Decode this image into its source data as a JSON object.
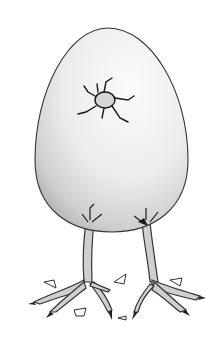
{
  "image": {
    "subject": "Cartoon egg standing on bird legs with a crack near the top",
    "colors": {
      "background": "#ffffff",
      "egg_light": "#f4f4f4",
      "egg_shadow": "#b8b8b8",
      "outline": "#333333",
      "crack": "#1a1a1a",
      "leg": "#c8c8c8"
    }
  }
}
